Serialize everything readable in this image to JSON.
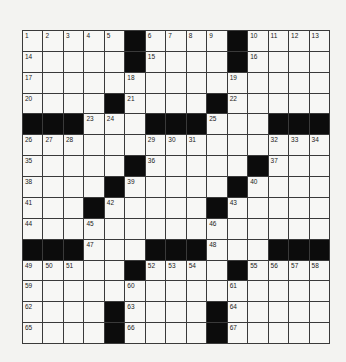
{
  "puzzle": {
    "rows": 15,
    "cols": 15,
    "colors": {
      "background": "#f3f3f1",
      "cell": "#f7f7f5",
      "block": "#0c0c0c",
      "grid_line": "#3a3a3a",
      "number": "#222222"
    },
    "grid": [
      "11111#1111#1111",
      "11111#1111#1111",
      "111111111111111",
      "1111#1111#11111",
      "###111###111###",
      "111111111111111",
      "11111#11111#111",
      "1111#11111#1111",
      "111#11111#11111",
      "111111111111111",
      "###111###111###",
      "11111#1111#1111",
      "111111111111111",
      "1111#1111#11111",
      "1111#1111#11111"
    ],
    "numbers": [
      {
        "r": 0,
        "c": 0,
        "n": "1"
      },
      {
        "r": 0,
        "c": 1,
        "n": "2"
      },
      {
        "r": 0,
        "c": 2,
        "n": "3"
      },
      {
        "r": 0,
        "c": 3,
        "n": "4"
      },
      {
        "r": 0,
        "c": 4,
        "n": "5"
      },
      {
        "r": 0,
        "c": 6,
        "n": "6"
      },
      {
        "r": 0,
        "c": 7,
        "n": "7"
      },
      {
        "r": 0,
        "c": 8,
        "n": "8"
      },
      {
        "r": 0,
        "c": 9,
        "n": "9"
      },
      {
        "r": 0,
        "c": 11,
        "n": "10"
      },
      {
        "r": 0,
        "c": 12,
        "n": "11"
      },
      {
        "r": 0,
        "c": 13,
        "n": "12"
      },
      {
        "r": 0,
        "c": 14,
        "n": "13"
      },
      {
        "r": 1,
        "c": 0,
        "n": "14"
      },
      {
        "r": 1,
        "c": 6,
        "n": "15"
      },
      {
        "r": 1,
        "c": 11,
        "n": "16"
      },
      {
        "r": 2,
        "c": 0,
        "n": "17"
      },
      {
        "r": 2,
        "c": 5,
        "n": "18"
      },
      {
        "r": 2,
        "c": 10,
        "n": "19"
      },
      {
        "r": 3,
        "c": 0,
        "n": "20"
      },
      {
        "r": 3,
        "c": 5,
        "n": "21"
      },
      {
        "r": 3,
        "c": 10,
        "n": "22"
      },
      {
        "r": 4,
        "c": 3,
        "n": "23"
      },
      {
        "r": 4,
        "c": 4,
        "n": "24"
      },
      {
        "r": 4,
        "c": 9,
        "n": "25"
      },
      {
        "r": 5,
        "c": 0,
        "n": "26"
      },
      {
        "r": 5,
        "c": 1,
        "n": "27"
      },
      {
        "r": 5,
        "c": 2,
        "n": "28"
      },
      {
        "r": 5,
        "c": 6,
        "n": "29"
      },
      {
        "r": 5,
        "c": 7,
        "n": "30"
      },
      {
        "r": 5,
        "c": 8,
        "n": "31"
      },
      {
        "r": 5,
        "c": 12,
        "n": "32"
      },
      {
        "r": 5,
        "c": 13,
        "n": "33"
      },
      {
        "r": 5,
        "c": 14,
        "n": "34"
      },
      {
        "r": 6,
        "c": 0,
        "n": "35"
      },
      {
        "r": 6,
        "c": 6,
        "n": "36"
      },
      {
        "r": 6,
        "c": 12,
        "n": "37"
      },
      {
        "r": 7,
        "c": 0,
        "n": "38"
      },
      {
        "r": 7,
        "c": 5,
        "n": "39"
      },
      {
        "r": 7,
        "c": 11,
        "n": "40"
      },
      {
        "r": 8,
        "c": 0,
        "n": "41"
      },
      {
        "r": 8,
        "c": 4,
        "n": "42"
      },
      {
        "r": 8,
        "c": 10,
        "n": "43"
      },
      {
        "r": 9,
        "c": 0,
        "n": "44"
      },
      {
        "r": 9,
        "c": 3,
        "n": "45"
      },
      {
        "r": 9,
        "c": 9,
        "n": "46"
      },
      {
        "r": 10,
        "c": 3,
        "n": "47"
      },
      {
        "r": 10,
        "c": 9,
        "n": "48"
      },
      {
        "r": 11,
        "c": 0,
        "n": "49"
      },
      {
        "r": 11,
        "c": 1,
        "n": "50"
      },
      {
        "r": 11,
        "c": 2,
        "n": "51"
      },
      {
        "r": 11,
        "c": 6,
        "n": "52"
      },
      {
        "r": 11,
        "c": 7,
        "n": "53"
      },
      {
        "r": 11,
        "c": 8,
        "n": "54"
      },
      {
        "r": 11,
        "c": 11,
        "n": "55"
      },
      {
        "r": 11,
        "c": 12,
        "n": "56"
      },
      {
        "r": 11,
        "c": 13,
        "n": "57"
      },
      {
        "r": 11,
        "c": 14,
        "n": "58"
      },
      {
        "r": 12,
        "c": 0,
        "n": "59"
      },
      {
        "r": 12,
        "c": 5,
        "n": "60"
      },
      {
        "r": 12,
        "c": 10,
        "n": "61"
      },
      {
        "r": 13,
        "c": 0,
        "n": "62"
      },
      {
        "r": 13,
        "c": 5,
        "n": "63"
      },
      {
        "r": 13,
        "c": 10,
        "n": "64"
      },
      {
        "r": 14,
        "c": 0,
        "n": "65"
      },
      {
        "r": 14,
        "c": 5,
        "n": "66"
      },
      {
        "r": 14,
        "c": 10,
        "n": "67"
      }
    ]
  }
}
